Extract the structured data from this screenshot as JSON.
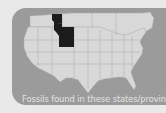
{
  "figure": {
    "caption": "Fossils found in these states/provinces",
    "highlighted_regions": [
      "Alberta",
      "Montana",
      "Wyoming"
    ],
    "colors": {
      "page_background": "#e9e9e9",
      "panel_background": "#9b9b9b",
      "land_fill": "#d8d8d8",
      "border_lines": "#a8a8a8",
      "highlight_fill": "#1c1c1c",
      "caption_text": "#e4e4e4"
    }
  }
}
